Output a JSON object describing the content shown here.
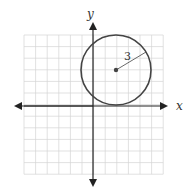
{
  "graph": {
    "x_label": "x",
    "y_label": "y",
    "radius_label": "3",
    "x_range": [
      -6,
      6
    ],
    "y_range": [
      -6,
      6
    ],
    "circle": {
      "center_x": 2,
      "center_y": 3,
      "radius": 3
    },
    "colors": {
      "grid": "#d4d4d4",
      "axis": "#222222",
      "circle": "#444444"
    }
  }
}
